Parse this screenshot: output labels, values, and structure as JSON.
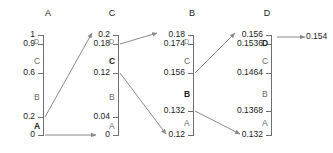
{
  "diagram": {
    "title": "",
    "columns": [
      {
        "header": "A",
        "bar_x": 43,
        "ticks": [
          {
            "label": "1",
            "y": 35
          },
          {
            "label": "0.9",
            "y": 44
          },
          {
            "label": "0.6",
            "y": 73
          },
          {
            "label": "0.2",
            "y": 117
          },
          {
            "label": "0",
            "y": 135
          }
        ],
        "segments": [
          {
            "label": "D",
            "y": 37,
            "style": "tiny"
          },
          {
            "label": "C",
            "y": 57,
            "style": "normal"
          },
          {
            "label": "B",
            "y": 93,
            "style": "normal"
          },
          {
            "label": "A",
            "y": 122,
            "style": "dark"
          }
        ]
      },
      {
        "header": "C",
        "bar_x": 118,
        "ticks": [
          {
            "label": "0.2",
            "y": 35
          },
          {
            "label": "0.18",
            "y": 44
          },
          {
            "label": "0.12",
            "y": 73
          },
          {
            "label": "0.04",
            "y": 117
          },
          {
            "label": "0",
            "y": 135
          }
        ],
        "segments": [
          {
            "label": "D",
            "y": 37,
            "style": "tiny"
          },
          {
            "label": "C",
            "y": 57,
            "style": "dark"
          },
          {
            "label": "B",
            "y": 93,
            "style": "normal"
          },
          {
            "label": "A",
            "y": 122,
            "style": "normal"
          }
        ]
      },
      {
        "header": "B",
        "bar_x": 193,
        "ticks": [
          {
            "label": "0.18",
            "y": 35
          },
          {
            "label": "0.174",
            "y": 44
          },
          {
            "label": "0.156",
            "y": 73
          },
          {
            "label": "0.132",
            "y": 111
          },
          {
            "label": "0.12",
            "y": 135
          }
        ],
        "segments": [
          {
            "label": "D",
            "y": 37,
            "style": "tiny"
          },
          {
            "label": "C",
            "y": 57,
            "style": "normal"
          },
          {
            "label": "B",
            "y": 90,
            "style": "dark"
          },
          {
            "label": "A",
            "y": 119,
            "style": "normal"
          }
        ]
      },
      {
        "header": "D",
        "bar_x": 271,
        "ticks": [
          {
            "label": "0.156",
            "y": 35
          },
          {
            "label": "0.1536",
            "y": 44
          },
          {
            "label": "0.1464",
            "y": 73
          },
          {
            "label": "0.1368",
            "y": 111
          },
          {
            "label": "0.132",
            "y": 135
          }
        ],
        "segments": [
          {
            "label": "D",
            "y": 39,
            "style": "dark"
          },
          {
            "label": "C",
            "y": 57,
            "style": "normal"
          },
          {
            "label": "B",
            "y": 90,
            "style": "normal"
          },
          {
            "label": "A",
            "y": 119,
            "style": "normal"
          }
        ]
      }
    ],
    "headers_pos": [
      {
        "label": "A",
        "x": 38,
        "y": 8
      },
      {
        "label": "C",
        "x": 102,
        "y": 8
      },
      {
        "label": "B",
        "x": 182,
        "y": 8
      },
      {
        "label": "D",
        "x": 257,
        "y": 8
      }
    ],
    "arrows": [
      {
        "name": "a02-to-c02",
        "x1": 45,
        "y1": 117,
        "x2": 92,
        "y2": 33
      },
      {
        "name": "a0-to-c0",
        "x1": 45,
        "y1": 135,
        "x2": 96,
        "y2": 135
      },
      {
        "name": "c018-to-b018",
        "x1": 120,
        "y1": 44,
        "x2": 157,
        "y2": 33
      },
      {
        "name": "c012-to-b012",
        "x1": 120,
        "y1": 73,
        "x2": 166,
        "y2": 134
      },
      {
        "name": "b0156-to-d0156",
        "x1": 195,
        "y1": 73,
        "x2": 235,
        "y2": 33
      },
      {
        "name": "b0132-to-d0132",
        "x1": 195,
        "y1": 111,
        "x2": 240,
        "y2": 134
      },
      {
        "name": "d-to-result",
        "x1": 277,
        "y1": 37,
        "x2": 305,
        "y2": 37
      }
    ],
    "result": {
      "label": "0.154",
      "x": 306,
      "y": 32
    },
    "colors": {
      "line": "#8a8a8a",
      "text": "#1a1a1a",
      "muted": "#6a6a6a",
      "bar": "#6f6f6f"
    }
  }
}
